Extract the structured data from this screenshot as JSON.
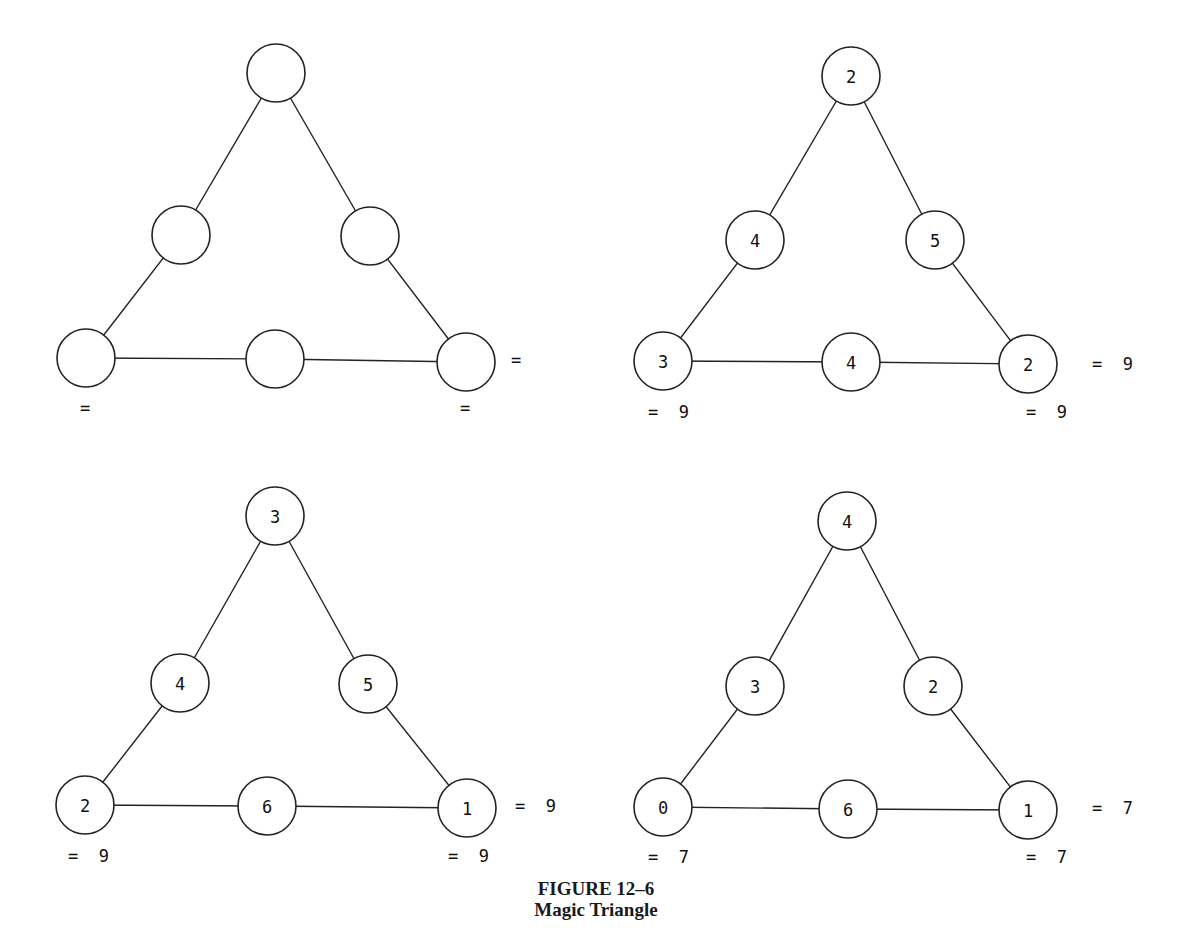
{
  "figure": {
    "label": "FIGURE 12–6",
    "title": "Magic Triangle"
  },
  "node_radius": 29,
  "triangles": [
    {
      "id": "blank",
      "nodes": {
        "top": {
          "x": 276,
          "y": 73,
          "value": ""
        },
        "mid_left": {
          "x": 181,
          "y": 235,
          "value": ""
        },
        "mid_right": {
          "x": 370,
          "y": 236,
          "value": ""
        },
        "bottom_left": {
          "x": 86,
          "y": 358,
          "value": ""
        },
        "bottom_mid": {
          "x": 275,
          "y": 359,
          "value": ""
        },
        "bottom_right": {
          "x": 466,
          "y": 362,
          "value": ""
        }
      },
      "sums": {
        "left": {
          "x": 80,
          "y": 408,
          "text": "="
        },
        "bottom": {
          "x": 460,
          "y": 408,
          "text": "="
        },
        "right": {
          "x": 511,
          "y": 360,
          "text": "="
        }
      }
    },
    {
      "id": "solution-9a",
      "nodes": {
        "top": {
          "x": 851,
          "y": 76,
          "value": "2"
        },
        "mid_left": {
          "x": 755,
          "y": 240,
          "value": "4"
        },
        "mid_right": {
          "x": 935,
          "y": 240,
          "value": "5"
        },
        "bottom_left": {
          "x": 663,
          "y": 361,
          "value": "3"
        },
        "bottom_mid": {
          "x": 851,
          "y": 362,
          "value": "4"
        },
        "bottom_right": {
          "x": 1028,
          "y": 364,
          "value": "2"
        }
      },
      "sums": {
        "left": {
          "x": 648,
          "y": 412,
          "text": "=  9"
        },
        "bottom": {
          "x": 1026,
          "y": 412,
          "text": "=  9"
        },
        "right": {
          "x": 1092,
          "y": 364,
          "text": "=  9"
        }
      }
    },
    {
      "id": "solution-9b",
      "nodes": {
        "top": {
          "x": 275,
          "y": 516,
          "value": "3"
        },
        "mid_left": {
          "x": 180,
          "y": 683,
          "value": "4"
        },
        "mid_right": {
          "x": 368,
          "y": 684,
          "value": "5"
        },
        "bottom_left": {
          "x": 85,
          "y": 805,
          "value": "2"
        },
        "bottom_mid": {
          "x": 267,
          "y": 806,
          "value": "6"
        },
        "bottom_right": {
          "x": 467,
          "y": 808,
          "value": "1"
        }
      },
      "sums": {
        "left": {
          "x": 68,
          "y": 856,
          "text": "=  9"
        },
        "bottom": {
          "x": 448,
          "y": 856,
          "text": "=  9"
        },
        "right": {
          "x": 515,
          "y": 806,
          "text": "=  9"
        }
      }
    },
    {
      "id": "solution-7",
      "nodes": {
        "top": {
          "x": 847,
          "y": 521,
          "value": "4"
        },
        "mid_left": {
          "x": 755,
          "y": 686,
          "value": "3"
        },
        "mid_right": {
          "x": 933,
          "y": 686,
          "value": "2"
        },
        "bottom_left": {
          "x": 663,
          "y": 807,
          "value": "0"
        },
        "bottom_mid": {
          "x": 848,
          "y": 809,
          "value": "6"
        },
        "bottom_right": {
          "x": 1028,
          "y": 810,
          "value": "1"
        }
      },
      "sums": {
        "left": {
          "x": 648,
          "y": 857,
          "text": "=  7"
        },
        "bottom": {
          "x": 1026,
          "y": 857,
          "text": "=  7"
        },
        "right": {
          "x": 1092,
          "y": 808,
          "text": "=  7"
        }
      }
    }
  ]
}
